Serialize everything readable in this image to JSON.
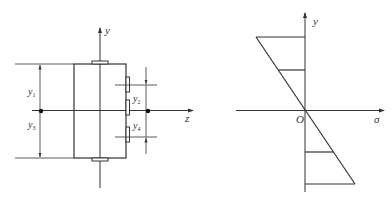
{
  "figure": {
    "left_panel": {
      "title": "cross-section",
      "axes": {
        "vertical": "y",
        "horizontal": "z"
      },
      "dimensions": [
        {
          "label": "y",
          "subscript": "1"
        },
        {
          "label": "y",
          "subscript": "3"
        },
        {
          "label": "y",
          "subscript": "2"
        },
        {
          "label": "y",
          "subscript": "4"
        }
      ]
    },
    "right_panel": {
      "title": "stress distribution",
      "axes": {
        "vertical": "y",
        "horizontal": "σ",
        "origin": "O"
      }
    },
    "colors": {
      "line": "#333333",
      "background": "#ffffff"
    }
  }
}
